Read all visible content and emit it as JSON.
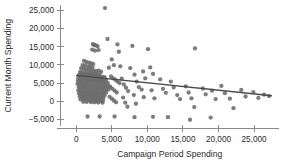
{
  "chart_data": {
    "type": "scatter",
    "title": "",
    "xlabel": "Campaign Period Spending",
    "ylabel": "Current Month Spending",
    "xlim": [
      -2200,
      28500
    ],
    "ylim": [
      -7500,
      27000
    ],
    "grid": false,
    "legend": null,
    "xticks": [
      0,
      5000,
      10000,
      15000,
      20000,
      25000
    ],
    "xticklabels": [
      "0",
      "5,000",
      "10,000",
      "15,000",
      "20,000",
      "25,000"
    ],
    "yticks": [
      -5000,
      0,
      5000,
      10000,
      15000,
      20000,
      25000
    ],
    "yticklabels": [
      "−5,000",
      "0",
      "5,000",
      "10,000",
      "15,000",
      "20,000",
      "25,000"
    ],
    "marker_color": "#6b6b6b",
    "line_color": "#4a4a4a",
    "axis_color": "#8a8a8a",
    "trend_line": {
      "x0": 0,
      "y0": 7100,
      "x1": 27500,
      "y1": 1500,
      "slope": -0.2036,
      "intercept": 7100
    },
    "points": [
      [
        4050,
        25600
      ],
      [
        2350,
        15700
      ],
      [
        2500,
        15500
      ],
      [
        2600,
        15400
      ],
      [
        2850,
        15300
      ],
      [
        3000,
        15100
      ],
      [
        2250,
        14200
      ],
      [
        2650,
        13900
      ],
      [
        3150,
        14050
      ],
      [
        4400,
        17100
      ],
      [
        5800,
        15600
      ],
      [
        6000,
        13600
      ],
      [
        7900,
        15200
      ],
      [
        10100,
        14300
      ],
      [
        16700,
        14500
      ],
      [
        1100,
        11100
      ],
      [
        1400,
        10800
      ],
      [
        1800,
        10600
      ],
      [
        2100,
        10400
      ],
      [
        2400,
        10200
      ],
      [
        900,
        9900
      ],
      [
        1250,
        9750
      ],
      [
        1650,
        9600
      ],
      [
        1950,
        9400
      ],
      [
        2300,
        9250
      ],
      [
        700,
        9050
      ],
      [
        1050,
        8900
      ],
      [
        1400,
        8750
      ],
      [
        1750,
        8600
      ],
      [
        2050,
        8450
      ],
      [
        2450,
        8350
      ],
      [
        2800,
        8250
      ],
      [
        3150,
        8400
      ],
      [
        3500,
        8100
      ],
      [
        550,
        8000
      ],
      [
        850,
        7900
      ],
      [
        1150,
        7800
      ],
      [
        1450,
        7700
      ],
      [
        1750,
        7600
      ],
      [
        2050,
        7550
      ],
      [
        2350,
        7500
      ],
      [
        2650,
        7450
      ],
      [
        2950,
        7400
      ],
      [
        3250,
        7350
      ],
      [
        400,
        7250
      ],
      [
        700,
        7200
      ],
      [
        1000,
        7150
      ],
      [
        1300,
        7100
      ],
      [
        1600,
        7050
      ],
      [
        1900,
        7000
      ],
      [
        2200,
        6950
      ],
      [
        2500,
        6900
      ],
      [
        2800,
        6850
      ],
      [
        3100,
        6800
      ],
      [
        3400,
        6750
      ],
      [
        3700,
        6700
      ],
      [
        4000,
        6650
      ],
      [
        300,
        6500
      ],
      [
        600,
        6450
      ],
      [
        900,
        6400
      ],
      [
        1200,
        6350
      ],
      [
        1500,
        6300
      ],
      [
        1800,
        6250
      ],
      [
        2100,
        6200
      ],
      [
        2400,
        6150
      ],
      [
        2700,
        6100
      ],
      [
        3000,
        6050
      ],
      [
        3300,
        6000
      ],
      [
        3600,
        5950
      ],
      [
        3900,
        5900
      ],
      [
        4200,
        5850
      ],
      [
        250,
        5700
      ],
      [
        550,
        5650
      ],
      [
        850,
        5600
      ],
      [
        1150,
        5550
      ],
      [
        1450,
        5500
      ],
      [
        1750,
        5450
      ],
      [
        2050,
        5400
      ],
      [
        2350,
        5350
      ],
      [
        2650,
        5300
      ],
      [
        2950,
        5250
      ],
      [
        3250,
        5200
      ],
      [
        3550,
        5150
      ],
      [
        3850,
        5100
      ],
      [
        4150,
        5050
      ],
      [
        4450,
        5000
      ],
      [
        200,
        4800
      ],
      [
        500,
        4750
      ],
      [
        800,
        4700
      ],
      [
        1100,
        4650
      ],
      [
        1400,
        4600
      ],
      [
        1700,
        4550
      ],
      [
        2000,
        4500
      ],
      [
        2300,
        4450
      ],
      [
        2600,
        4400
      ],
      [
        2900,
        4350
      ],
      [
        3200,
        4300
      ],
      [
        3500,
        4250
      ],
      [
        3800,
        4200
      ],
      [
        4100,
        4150
      ],
      [
        4400,
        4100
      ],
      [
        4700,
        4050
      ],
      [
        350,
        3900
      ],
      [
        650,
        3850
      ],
      [
        950,
        3800
      ],
      [
        1250,
        3750
      ],
      [
        1550,
        3700
      ],
      [
        1850,
        3650
      ],
      [
        2150,
        3600
      ],
      [
        2450,
        3550
      ],
      [
        2750,
        3500
      ],
      [
        3050,
        3450
      ],
      [
        3350,
        3400
      ],
      [
        3650,
        3350
      ],
      [
        3950,
        3300
      ],
      [
        4250,
        3250
      ],
      [
        4550,
        3200
      ],
      [
        300,
        3000
      ],
      [
        600,
        2950
      ],
      [
        900,
        2900
      ],
      [
        1200,
        2850
      ],
      [
        1500,
        2800
      ],
      [
        1800,
        2750
      ],
      [
        2100,
        2700
      ],
      [
        2400,
        2650
      ],
      [
        2700,
        2600
      ],
      [
        3000,
        2550
      ],
      [
        3300,
        2500
      ],
      [
        3600,
        2450
      ],
      [
        3900,
        2400
      ],
      [
        4200,
        2350
      ],
      [
        400,
        2150
      ],
      [
        700,
        2100
      ],
      [
        1000,
        2050
      ],
      [
        1300,
        2000
      ],
      [
        1600,
        1950
      ],
      [
        1900,
        1900
      ],
      [
        2200,
        1850
      ],
      [
        2500,
        1800
      ],
      [
        2800,
        1750
      ],
      [
        3100,
        1700
      ],
      [
        3400,
        1650
      ],
      [
        3700,
        1600
      ],
      [
        4000,
        1550
      ],
      [
        500,
        1300
      ],
      [
        800,
        1250
      ],
      [
        1100,
        1200
      ],
      [
        1400,
        1150
      ],
      [
        1700,
        1100
      ],
      [
        2000,
        1050
      ],
      [
        2300,
        1000
      ],
      [
        2600,
        950
      ],
      [
        2900,
        900
      ],
      [
        3200,
        850
      ],
      [
        3500,
        800
      ],
      [
        3800,
        750
      ],
      [
        600,
        500
      ],
      [
        950,
        450
      ],
      [
        1300,
        400
      ],
      [
        1650,
        350
      ],
      [
        2000,
        300
      ],
      [
        2350,
        250
      ],
      [
        2700,
        200
      ],
      [
        3050,
        150
      ],
      [
        3400,
        100
      ],
      [
        3750,
        50
      ],
      [
        1000,
        -150
      ],
      [
        1500,
        -200
      ],
      [
        2100,
        -250
      ],
      [
        2600,
        -300
      ],
      [
        3100,
        -350
      ],
      [
        3700,
        -400
      ],
      [
        4900,
        6800
      ],
      [
        5200,
        6300
      ],
      [
        5500,
        5900
      ],
      [
        5800,
        5400
      ],
      [
        6100,
        5000
      ],
      [
        4800,
        3900
      ],
      [
        5100,
        3400
      ],
      [
        5400,
        2900
      ],
      [
        5700,
        2400
      ],
      [
        4700,
        1200
      ],
      [
        5000,
        700
      ],
      [
        5300,
        200
      ],
      [
        5600,
        -300
      ],
      [
        6400,
        6200
      ],
      [
        6700,
        4600
      ],
      [
        7000,
        3700
      ],
      [
        7300,
        2800
      ],
      [
        6600,
        1000
      ],
      [
        6900,
        -400
      ],
      [
        7200,
        -1500
      ],
      [
        5000,
        11500
      ],
      [
        5300,
        9900
      ],
      [
        4600,
        9200
      ],
      [
        6200,
        9600
      ],
      [
        7600,
        9100
      ],
      [
        8200,
        7300
      ],
      [
        8500,
        5400
      ],
      [
        8800,
        3900
      ],
      [
        8100,
        1700
      ],
      [
        8400,
        -700
      ],
      [
        9400,
        8200
      ],
      [
        9700,
        6300
      ],
      [
        9200,
        3200
      ],
      [
        9500,
        1100
      ],
      [
        10400,
        9300
      ],
      [
        10800,
        7500
      ],
      [
        10600,
        3000
      ],
      [
        11000,
        800
      ],
      [
        11800,
        6000
      ],
      [
        12200,
        3400
      ],
      [
        12600,
        2300
      ],
      [
        13300,
        5400
      ],
      [
        13700,
        3800
      ],
      [
        14200,
        1700
      ],
      [
        14600,
        600
      ],
      [
        15400,
        4100
      ],
      [
        15800,
        2400
      ],
      [
        16200,
        800
      ],
      [
        16600,
        -1600
      ],
      [
        17800,
        3500
      ],
      [
        18200,
        1900
      ],
      [
        19100,
        2900
      ],
      [
        19600,
        600
      ],
      [
        20400,
        4200
      ],
      [
        20900,
        2200
      ],
      [
        21600,
        700
      ],
      [
        22100,
        -1900
      ],
      [
        23200,
        3100
      ],
      [
        23800,
        1300
      ],
      [
        24900,
        2500
      ],
      [
        25600,
        900
      ],
      [
        26400,
        1800
      ],
      [
        27100,
        1400
      ],
      [
        1600,
        -4200
      ],
      [
        3300,
        -4200
      ],
      [
        5400,
        -4200
      ],
      [
        8200,
        -4400
      ],
      [
        10800,
        -4300
      ],
      [
        12900,
        -4400
      ],
      [
        16000,
        -5100
      ],
      [
        18900,
        -4500
      ]
    ]
  },
  "axis_titles": {
    "x": "Campaign Period Spending",
    "y": "Current Month Spending"
  }
}
